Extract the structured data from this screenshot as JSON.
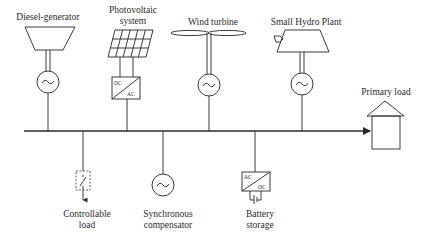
{
  "diagram": {
    "sources": [
      {
        "id": "diesel",
        "label": "Diesel-generator",
        "icon": "diesel-engine-icon",
        "generator": "~"
      },
      {
        "id": "pv",
        "label_line1": "Photovoltaic",
        "label_line2": "system",
        "icon": "solar-panel-icon",
        "converter": {
          "top": "DC",
          "bottom": "AC"
        }
      },
      {
        "id": "wind",
        "label": "Wind turbine",
        "icon": "wind-turbine-icon",
        "generator": "~"
      },
      {
        "id": "hydro",
        "label": "Small Hydro Plant",
        "icon": "hydro-turbine-icon",
        "generator": "~"
      }
    ],
    "bus": {
      "label": "AC bus",
      "direction": "right-arrow"
    },
    "primary_load": {
      "label": "Primary load",
      "icon": "house-icon"
    },
    "loads": [
      {
        "id": "controllable",
        "label_line1": "Controllable",
        "label_line2": "load",
        "icon": "switch-icon"
      },
      {
        "id": "syncomp",
        "label_line1": "Synchronous",
        "label_line2": "compensator",
        "icon": "generator-icon",
        "symbol": "~"
      },
      {
        "id": "battery",
        "label_line1": "Battery",
        "label_line2": "storage",
        "icon": "battery-icon",
        "converter": {
          "top": "AC",
          "bottom": "DC"
        }
      }
    ],
    "colors": {
      "line": "#3a3a3a",
      "background": "#ffffff",
      "text": "#2a2a2a"
    }
  }
}
